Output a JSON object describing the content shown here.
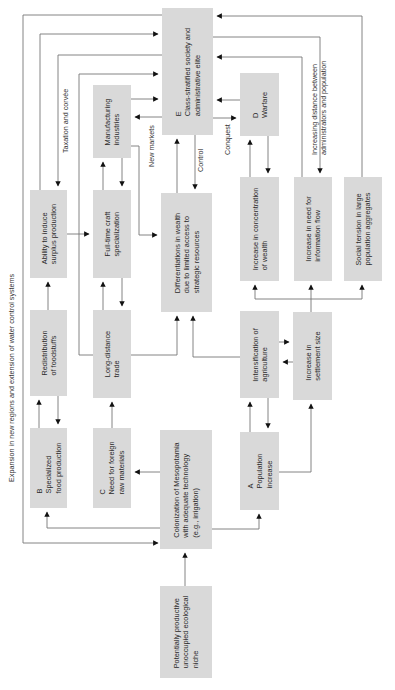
{
  "diagram": {
    "title_side_label": "Expansion in new regions and extension of water control systems",
    "nodes": {
      "E": {
        "letter": "E",
        "lines": [
          "Class-stratified society and",
          "administrative elite"
        ]
      },
      "manufacturing": {
        "lines": [
          "Manufacturing",
          "industries"
        ]
      },
      "D": {
        "letter": "D",
        "lines": [
          "Warfare"
        ]
      },
      "ability": {
        "lines": [
          "Ability to induce",
          "surplus production"
        ]
      },
      "fulltime": {
        "lines": [
          "Full-time craft",
          "specialization"
        ]
      },
      "differentiations": {
        "lines": [
          "Differentiations in wealth",
          "due to limited access to",
          "strategic resources"
        ]
      },
      "concentration": {
        "lines": [
          "Increase in concentration",
          "of wealth"
        ]
      },
      "information": {
        "lines": [
          "Increase in need for",
          "information flow"
        ]
      },
      "tension": {
        "lines": [
          "Social tension in large",
          "population aggregates"
        ]
      },
      "redistribution": {
        "lines": [
          "Redistribution",
          "of foodstuffs"
        ]
      },
      "longdistance": {
        "lines": [
          "Long-distance",
          "trade"
        ]
      },
      "intensification": {
        "lines": [
          "Intensification of",
          "agriculture"
        ]
      },
      "settlement": {
        "lines": [
          "Increase in",
          "settlement size"
        ]
      },
      "B": {
        "letter": "B",
        "lines": [
          "Specialized",
          "food production"
        ]
      },
      "C": {
        "letter": "C",
        "lines": [
          "Need for foreign",
          "raw materials"
        ]
      },
      "colonization": {
        "lines": [
          "Colonization of Mesopotamia",
          "with adequate technology",
          "(e.g., irrigation)"
        ]
      },
      "A": {
        "letter": "A",
        "lines": [
          "Population",
          "increase"
        ]
      },
      "niche": {
        "lines": [
          "Potentially productive",
          "unoccupied ecological",
          "niche"
        ]
      }
    },
    "edge_labels": {
      "taxation": "Taxation and corvée",
      "new_markets": "New markets",
      "control": "Control",
      "conquest": "Conquest",
      "distance": [
        "Increasing distance between",
        "administrators and population"
      ]
    },
    "colors": {
      "box_fill": "#d9d9d9",
      "line": "#555555",
      "arrow": "#111111",
      "text": "#2a2a2a"
    }
  }
}
